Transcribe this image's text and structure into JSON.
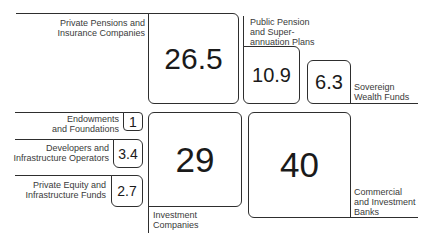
{
  "diagram": {
    "type": "proportional-box-diagram",
    "items": [
      {
        "id": "private_pensions",
        "label": "Private Pensions and\nInsurance Companies",
        "value": "26.5"
      },
      {
        "id": "public_pension",
        "label": "Public Pension\nand Super-\nannuation Plans",
        "value": "10.9"
      },
      {
        "id": "sovereign_wealth",
        "label": "Sovereign\nWealth Funds",
        "value": "6.3"
      },
      {
        "id": "endowments",
        "label": "Endowments\nand Foundations",
        "value": "1"
      },
      {
        "id": "developers",
        "label": "Developers and\nInfrastructure Operators",
        "value": "3.4"
      },
      {
        "id": "private_equity",
        "label": "Private Equity and\nInfrastructure Funds",
        "value": "2.7"
      },
      {
        "id": "investment_companies",
        "label": "Investment\nCompanies",
        "value": "29"
      },
      {
        "id": "banks",
        "label": "Commercial\nand Investment\nBanks",
        "value": "40"
      }
    ]
  },
  "colors": {
    "line": "#2e2e2e",
    "text": "#2a2a2a",
    "background": "#ffffff"
  }
}
